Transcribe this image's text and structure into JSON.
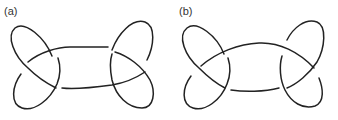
{
  "figure": {
    "panels": [
      {
        "id": "a",
        "label": "(a)",
        "description": "knot projection with straight horizontal connecting strands"
      },
      {
        "id": "b",
        "label": "(b)",
        "description": "knot projection with arched top connecting strand"
      }
    ]
  },
  "colors": {
    "stroke": "#222222",
    "background": "#ffffff",
    "label": "#333333"
  }
}
